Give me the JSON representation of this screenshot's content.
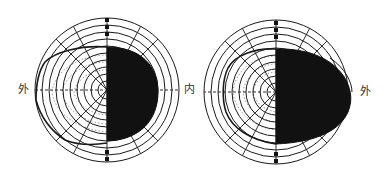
{
  "figure": {
    "type": "visual-field perimetry charts (hemianopia)",
    "colors": {
      "ink": "#1a1a1a",
      "background": "#ffffff"
    },
    "left_field": {
      "label_left": "外",
      "label_right": "内",
      "blind_half": "right",
      "rings": 10
    },
    "right_field": {
      "label_left": "内",
      "label_right": "外",
      "blind_half": "right",
      "rings": 10
    }
  }
}
